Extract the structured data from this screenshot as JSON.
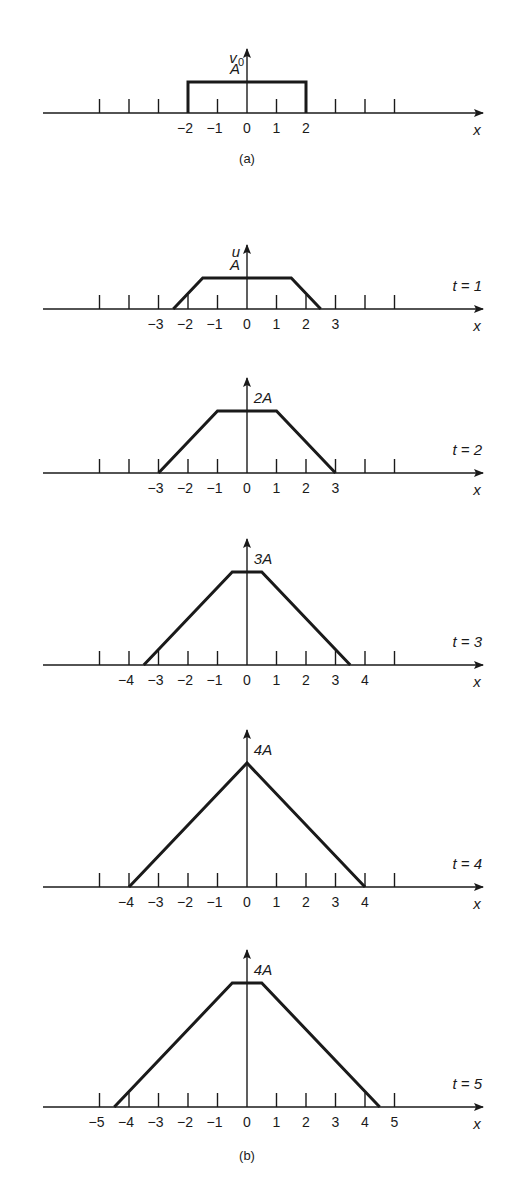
{
  "figure": {
    "colors": {
      "ink": "#1a1a1a",
      "background": "#ffffff"
    },
    "layout": {
      "zero_x": 247,
      "unit_px": 29.5,
      "amp_px": 31,
      "axis_left": 43,
      "axis_right": 483
    },
    "panel_a": {
      "caption": "(a)",
      "y_label": "v",
      "y_label_sub": "0",
      "x_label": "x",
      "value_label": "A",
      "axis_y": 113,
      "tick_labels": [
        "−2",
        "−1",
        "0",
        "1",
        "2"
      ],
      "tick_values": [
        -2,
        -1,
        0,
        1,
        2
      ],
      "shape": [
        [
          -2,
          0
        ],
        [
          -2,
          1
        ],
        [
          2,
          1
        ],
        [
          2,
          0
        ]
      ]
    },
    "panel_b": {
      "caption": "(b)",
      "panels": [
        {
          "t_label": "t = 1",
          "y_label": "u",
          "value_label": "A",
          "axis_y": 309,
          "tick_labels": [
            "−3",
            "−2",
            "−1",
            "0",
            "1",
            "2",
            "3"
          ],
          "tick_values": [
            -3,
            -2,
            -1,
            0,
            1,
            2,
            3
          ],
          "shape": [
            [
              -2.5,
              0
            ],
            [
              -1.5,
              1
            ],
            [
              1.5,
              1
            ],
            [
              2.5,
              0
            ]
          ]
        },
        {
          "t_label": "t = 2",
          "y_label": "",
          "value_label": "2A",
          "axis_y": 473,
          "tick_labels": [
            "−3",
            "−2",
            "−1",
            "0",
            "1",
            "2",
            "3"
          ],
          "tick_values": [
            -3,
            -2,
            -1,
            0,
            1,
            2,
            3
          ],
          "shape": [
            [
              -3,
              0
            ],
            [
              -1,
              2
            ],
            [
              1,
              2
            ],
            [
              3,
              0
            ]
          ]
        },
        {
          "t_label": "t = 3",
          "y_label": "",
          "value_label": "3A",
          "axis_y": 665,
          "tick_labels": [
            "−4",
            "−3",
            "−2",
            "−1",
            "0",
            "1",
            "2",
            "3",
            "4"
          ],
          "tick_values": [
            -4,
            -3,
            -2,
            -1,
            0,
            1,
            2,
            3,
            4
          ],
          "shape": [
            [
              -3.5,
              0
            ],
            [
              -0.5,
              3
            ],
            [
              0.5,
              3
            ],
            [
              3.5,
              0
            ]
          ]
        },
        {
          "t_label": "t = 4",
          "y_label": "",
          "value_label": "4A",
          "axis_y": 887,
          "tick_labels": [
            "−4",
            "−3",
            "−2",
            "−1",
            "0",
            "1",
            "2",
            "3",
            "4"
          ],
          "tick_values": [
            -4,
            -3,
            -2,
            -1,
            0,
            1,
            2,
            3,
            4
          ],
          "shape": [
            [
              -4,
              0
            ],
            [
              0,
              4
            ],
            [
              4,
              0
            ]
          ]
        },
        {
          "t_label": "t = 5",
          "y_label": "",
          "value_label": "4A",
          "axis_y": 1107,
          "tick_labels": [
            "−5",
            "−4",
            "−3",
            "−2",
            "−1",
            "0",
            "1",
            "2",
            "3",
            "4",
            "5"
          ],
          "tick_values": [
            -5,
            -4,
            -3,
            -2,
            -1,
            0,
            1,
            2,
            3,
            4,
            5
          ],
          "shape": [
            [
              -4.5,
              0
            ],
            [
              -0.5,
              4
            ],
            [
              0.5,
              4
            ],
            [
              4.5,
              0
            ]
          ]
        }
      ]
    },
    "x_label": "x"
  },
  "chart_data": {
    "type": "line",
    "title": "",
    "xlabel": "x",
    "ylabel": "u",
    "series": [
      {
        "name": "v0 (a)",
        "x": [
          -2,
          -2,
          2,
          2
        ],
        "y": [
          0,
          1,
          1,
          0
        ]
      },
      {
        "name": "t = 1",
        "x": [
          -2.5,
          -1.5,
          1.5,
          2.5
        ],
        "y": [
          0,
          1,
          1,
          0
        ]
      },
      {
        "name": "t = 2",
        "x": [
          -3,
          -1,
          1,
          3
        ],
        "y": [
          0,
          2,
          2,
          0
        ]
      },
      {
        "name": "t = 3",
        "x": [
          -3.5,
          -0.5,
          0.5,
          3.5
        ],
        "y": [
          0,
          3,
          3,
          0
        ]
      },
      {
        "name": "t = 4",
        "x": [
          -4,
          0,
          4
        ],
        "y": [
          0,
          4,
          0
        ]
      },
      {
        "name": "t = 5",
        "x": [
          -4.5,
          -0.5,
          0.5,
          4.5
        ],
        "y": [
          0,
          4,
          4,
          0
        ]
      }
    ],
    "y_units": "A",
    "xlim": [
      -6.5,
      8
    ],
    "grid": false
  }
}
